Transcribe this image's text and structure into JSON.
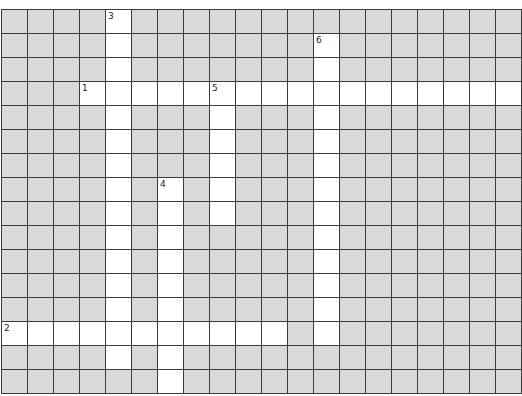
{
  "puzzle": {
    "cols": 20,
    "rows": 16,
    "colors": {
      "blocked": "#d9d9d9",
      "open": "#ffffff",
      "grid_line": "#3c3c3c",
      "number": "#222222"
    },
    "entries": [
      {
        "number": "1",
        "direction": "across",
        "row": 3,
        "col": 3,
        "length": 17
      },
      {
        "number": "2",
        "direction": "across",
        "row": 13,
        "col": 0,
        "length": 11
      },
      {
        "number": "3",
        "direction": "down",
        "row": 0,
        "col": 4,
        "length": 15
      },
      {
        "number": "4",
        "direction": "down",
        "row": 7,
        "col": 6,
        "length": 9
      },
      {
        "number": "5",
        "direction": "down",
        "row": 3,
        "col": 8,
        "length": 6
      },
      {
        "number": "6",
        "direction": "down",
        "row": 1,
        "col": 12,
        "length": 13
      }
    ]
  }
}
